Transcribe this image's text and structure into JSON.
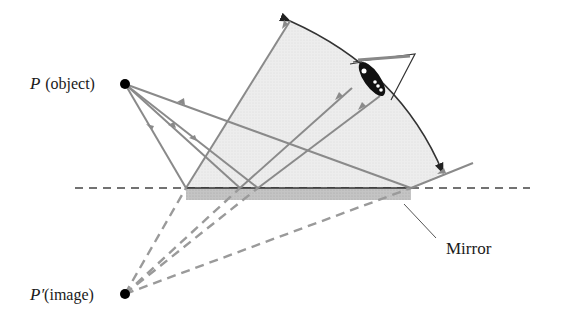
{
  "diagram": {
    "labels": {
      "object_symbol": "P",
      "object_text": "(object)",
      "image_symbol": "P′",
      "image_text": "(image)",
      "mirror": "Mirror"
    },
    "points": {
      "object": {
        "x": 125,
        "y": 84
      },
      "image": {
        "x": 125,
        "y": 294
      }
    },
    "mirror": {
      "x1": 186,
      "x2": 411,
      "y": 188,
      "thickness": 12
    },
    "colors": {
      "ray": "#8a8a8a",
      "dashed_ray": "#9a9a9a",
      "fan_fill": "#ececec",
      "mirror_fill": "#bdbdbd",
      "outline": "#333333",
      "point": "#000000"
    }
  }
}
